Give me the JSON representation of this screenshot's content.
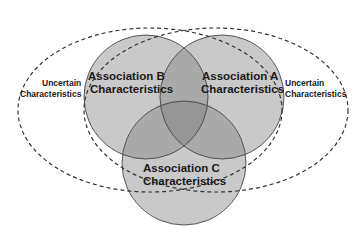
{
  "diagram": {
    "type": "venn",
    "colors": {
      "circle_fill": "#c9c9c9",
      "overlap_fill": "#a9a9a9",
      "center_fill": "#969696",
      "circle_stroke": "#444444",
      "dashed_stroke": "#333333",
      "text": "#1a1a1a",
      "background": "#ffffff"
    },
    "circles": [
      {
        "id": "B",
        "line1": "Association B",
        "line2": "Characteristics"
      },
      {
        "id": "A",
        "line1": "Association A",
        "line2": "Characteristics"
      },
      {
        "id": "C",
        "line1": "Association C",
        "line2": "Characteristics"
      }
    ],
    "uncertain": [
      {
        "side": "left",
        "line1": "Uncertain",
        "line2": "Characteristics"
      },
      {
        "side": "right",
        "line1": "Uncertain",
        "line2": "Characteristics"
      }
    ]
  }
}
